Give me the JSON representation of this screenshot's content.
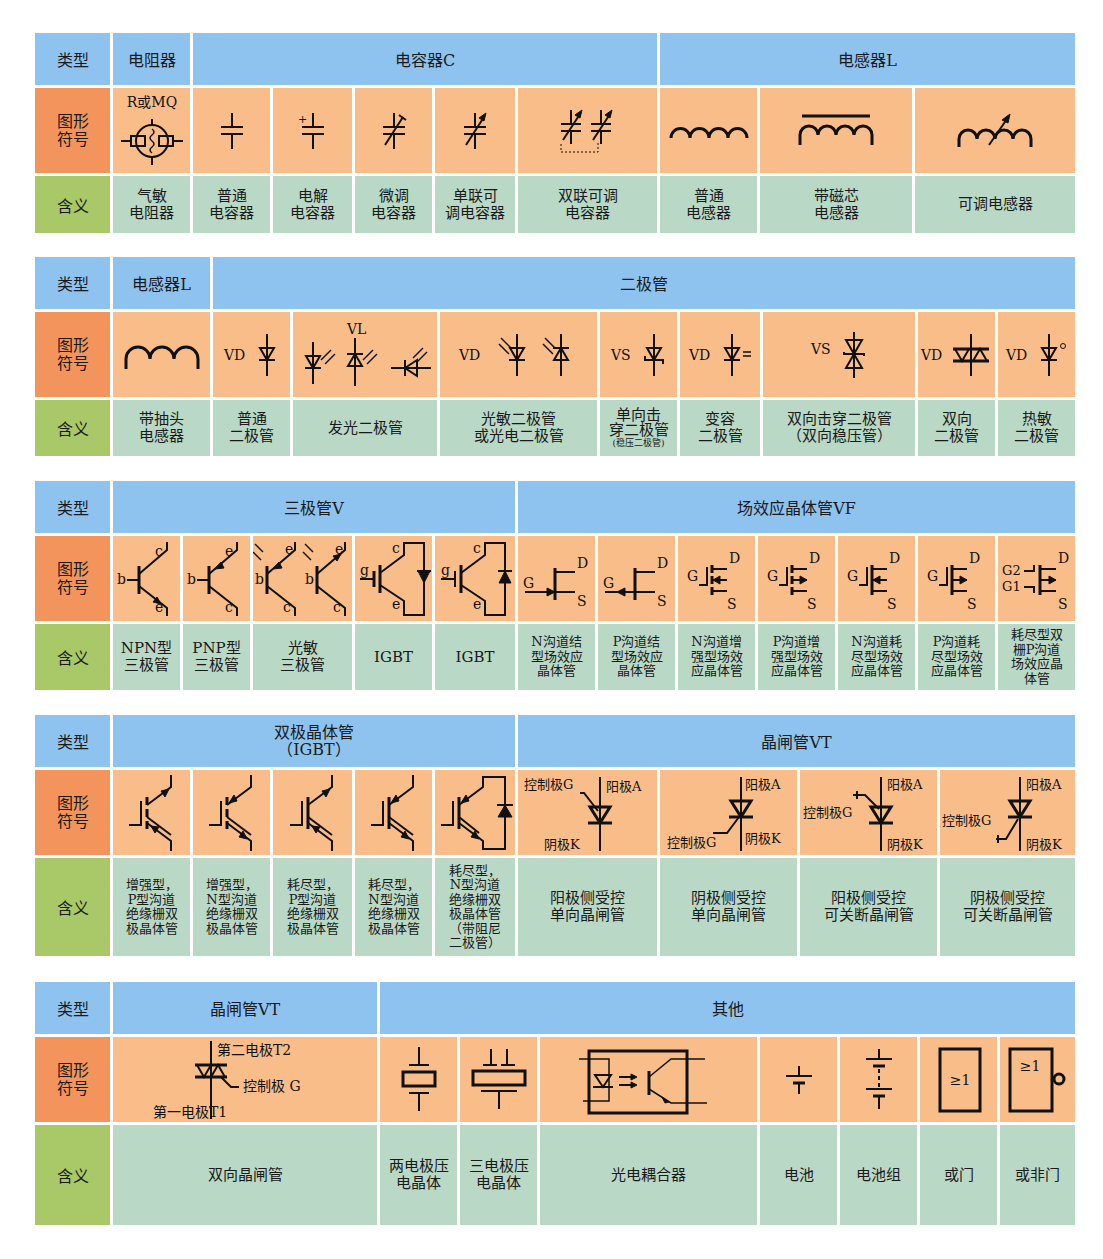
{
  "row_labels": {
    "type": "类型",
    "symbol": "图形\n符号",
    "meaning": "含义"
  },
  "colors": {
    "header_blue": "#8ec3ef",
    "symbol_label_orange": "#f2945c",
    "symbol_cell_orange": "#f9bd8a",
    "meaning_label_green": "#a9c968",
    "meaning_cell_green": "#b9d8c6"
  },
  "sections": [
    {
      "headers": [
        "电阻器",
        "电容器C",
        "电感器L"
      ],
      "items": [
        {
          "symbol": "gas-sensitive-resistor",
          "symbol_label": "R或MQ",
          "meaning": "气敏\n电阻器"
        },
        {
          "symbol": "capacitor",
          "meaning": "普通\n电容器"
        },
        {
          "symbol": "electrolytic-capacitor",
          "symbol_label": "+",
          "meaning": "电解\n电容器"
        },
        {
          "symbol": "trimmer-capacitor",
          "meaning": "微调\n电容器"
        },
        {
          "symbol": "variable-capacitor",
          "meaning": "单联可\n调电容器"
        },
        {
          "symbol": "dual-variable-capacitor",
          "meaning": "双联可调\n电容器"
        },
        {
          "symbol": "inductor",
          "meaning": "普通\n电感器"
        },
        {
          "symbol": "iron-core-inductor",
          "meaning": "带磁芯\n电感器"
        },
        {
          "symbol": "variable-inductor",
          "meaning": "可调电感器"
        }
      ]
    },
    {
      "headers": [
        "电感器L",
        "二极管"
      ],
      "items": [
        {
          "symbol": "tapped-inductor",
          "meaning": "带抽头\n电感器"
        },
        {
          "symbol": "diode",
          "symbol_label": "VD",
          "meaning": "普通\n二极管"
        },
        {
          "symbol": "led",
          "symbol_label": "VL",
          "meaning": "发光二极管"
        },
        {
          "symbol": "photodiode",
          "symbol_label": "VD",
          "meaning": "光敏二极管\n或光电二极管"
        },
        {
          "symbol": "zener-diode",
          "symbol_label": "VS",
          "meaning": "单向击\n穿二极管",
          "meaning_note": "(稳压二极管)"
        },
        {
          "symbol": "varactor-diode",
          "symbol_label": "VD",
          "meaning": "变容\n二极管"
        },
        {
          "symbol": "bidirectional-zener",
          "symbol_label": "VS",
          "meaning": "双向击穿二极管\n（双向稳压管）"
        },
        {
          "symbol": "diac",
          "symbol_label": "VD",
          "meaning": "双向\n二极管"
        },
        {
          "symbol": "thermal-diode",
          "symbol_label": "VD",
          "meaning": "热敏\n二极管"
        }
      ]
    },
    {
      "headers": [
        "三极管V",
        "场效应晶体管VF"
      ],
      "items": [
        {
          "symbol": "npn-transistor",
          "pins": [
            "b",
            "c",
            "e"
          ],
          "meaning": "NPN型\n三极管"
        },
        {
          "symbol": "pnp-transistor",
          "pins": [
            "b",
            "e",
            "c"
          ],
          "meaning": "PNP型\n三极管"
        },
        {
          "symbol": "phototransistor",
          "pins": [
            "b",
            "e",
            "c"
          ],
          "meaning": "光敏\n三极管"
        },
        {
          "symbol": "igbt-n",
          "pins": [
            "g",
            "c",
            "e"
          ],
          "meaning": "IGBT"
        },
        {
          "symbol": "igbt-p",
          "pins": [
            "g",
            "c",
            "e"
          ],
          "meaning": "IGBT"
        },
        {
          "symbol": "n-jfet",
          "pins": [
            "G",
            "D",
            "S"
          ],
          "meaning": "N沟道结\n型场效应\n晶体管"
        },
        {
          "symbol": "p-jfet",
          "pins": [
            "G",
            "D",
            "S"
          ],
          "meaning": "P沟道结\n型场效应\n晶体管"
        },
        {
          "symbol": "n-enh-mosfet",
          "pins": [
            "G",
            "D",
            "S"
          ],
          "meaning": "N沟道增\n强型场效\n应晶体管"
        },
        {
          "symbol": "p-enh-mosfet",
          "pins": [
            "G",
            "D",
            "S"
          ],
          "meaning": "P沟道增\n强型场效\n应晶体管"
        },
        {
          "symbol": "n-dep-mosfet",
          "pins": [
            "G",
            "D",
            "S"
          ],
          "meaning": "N沟道耗\n尽型场效\n应晶体管"
        },
        {
          "symbol": "p-dep-mosfet",
          "pins": [
            "G",
            "D",
            "S"
          ],
          "meaning": "P沟道耗\n尽型场效\n应晶体管"
        },
        {
          "symbol": "dual-gate-mosfet",
          "pins": [
            "G2",
            "G1",
            "D",
            "S"
          ],
          "meaning": "耗尽型双\n栅P沟道\n场效应晶\n体管"
        }
      ]
    },
    {
      "headers": [
        "双极晶体管\n（IGBT）",
        "晶闸管VT"
      ],
      "items": [
        {
          "symbol": "igbt-enh-p",
          "meaning": "增强型，\nP型沟道\n绝缘栅双\n极晶体管"
        },
        {
          "symbol": "igbt-enh-n",
          "meaning": "增强型，\nN型沟道\n绝缘栅双\n极晶体管"
        },
        {
          "symbol": "igbt-dep-p",
          "meaning": "耗尽型，\nP型沟道\n绝缘栅双\n极晶体管"
        },
        {
          "symbol": "igbt-dep-n",
          "meaning": "耗尽型，\nN型沟道\n绝缘栅双\n极晶体管"
        },
        {
          "symbol": "igbt-dep-n-diode",
          "meaning": "耗尽型，\nN型沟道\n绝缘栅双\n极晶体管\n（带阻尼\n二极管）"
        },
        {
          "symbol": "scr-anode-gate",
          "gate": "控制极G",
          "anode": "阳极A",
          "cathode": "阴极K",
          "meaning": "阳极侧受控\n单向晶闸管"
        },
        {
          "symbol": "scr-cathode-gate",
          "gate": "控制极G",
          "anode": "阳极A",
          "cathode": "阴极K",
          "meaning": "阴极侧受控\n单向晶闸管"
        },
        {
          "symbol": "gto-anode-gate",
          "gate": "控制极G",
          "anode": "阳极A",
          "cathode": "阴极K",
          "meaning": "阳极侧受控\n可关断晶闸管"
        },
        {
          "symbol": "gto-cathode-gate",
          "gate": "控制极G",
          "anode": "阳极A",
          "cathode": "阴极K",
          "meaning": "阴极侧受控\n可关断晶闸管"
        }
      ]
    },
    {
      "headers": [
        "晶闸管VT",
        "其他"
      ],
      "items": [
        {
          "symbol": "triac",
          "t2": "第二电极T2",
          "gate": "控制极 G",
          "t1": "第一电极T1",
          "meaning": "双向晶闸管"
        },
        {
          "symbol": "two-electrode-crystal",
          "meaning": "两电极压\n电晶体"
        },
        {
          "symbol": "three-electrode-crystal",
          "meaning": "三电极压\n电晶体"
        },
        {
          "symbol": "optocoupler",
          "meaning": "光电耦合器"
        },
        {
          "symbol": "battery",
          "meaning": "电池"
        },
        {
          "symbol": "battery-pack",
          "meaning": "电池组"
        },
        {
          "symbol": "or-gate",
          "gate_label": "≥1",
          "meaning": "或门"
        },
        {
          "symbol": "nor-gate",
          "gate_label": "≥1",
          "meaning": "或非门"
        }
      ]
    }
  ]
}
